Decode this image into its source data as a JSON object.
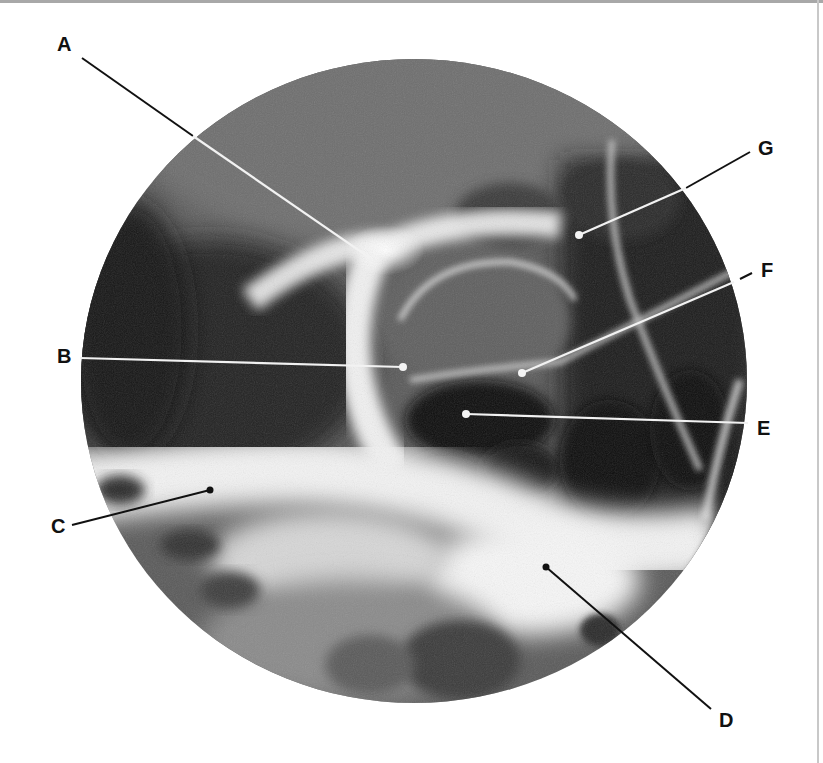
{
  "figure": {
    "type": "radiograph-with-labels",
    "view": "circular-field",
    "colors": {
      "background": "#ffffff",
      "label_text": "#111111",
      "leader_on_dark": "#f2f2f2",
      "leader_on_light": "#111111"
    }
  },
  "labels": [
    {
      "id": "A",
      "text": "A",
      "x": 57,
      "y": 34
    },
    {
      "id": "B",
      "text": "B",
      "x": 57,
      "y": 346
    },
    {
      "id": "C",
      "text": "C",
      "x": 51,
      "y": 516
    },
    {
      "id": "D",
      "text": "D",
      "x": 719,
      "y": 710
    },
    {
      "id": "E",
      "text": "E",
      "x": 757,
      "y": 418
    },
    {
      "id": "F",
      "text": "F",
      "x": 761,
      "y": 260
    },
    {
      "id": "G",
      "text": "G",
      "x": 758,
      "y": 138
    }
  ]
}
